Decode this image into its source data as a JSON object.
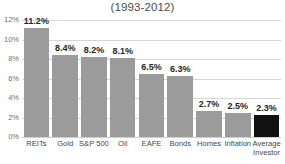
{
  "chart_data": {
    "type": "bar",
    "title": "(1993-2012)",
    "xlabel": "",
    "ylabel": "",
    "ylim": [
      0,
      12
    ],
    "grid": true,
    "legend": null,
    "y_ticks": [
      "0%",
      "2%",
      "4%",
      "6%",
      "8%",
      "10%",
      "12%"
    ],
    "y_tick_values": [
      0,
      2,
      4,
      6,
      8,
      10,
      12
    ],
    "categories": [
      "REITs",
      "Gold",
      "S&P 500",
      "Oil",
      "EAFE",
      "Bonds",
      "Homes",
      "Inflation",
      "Average Investor"
    ],
    "category_lines": [
      [
        "REITs"
      ],
      [
        "Gold"
      ],
      [
        "S&P 500"
      ],
      [
        "Oil"
      ],
      [
        "EAFE"
      ],
      [
        "Bonds"
      ],
      [
        "Homes"
      ],
      [
        "Inflation"
      ],
      [
        "Average",
        "Investor"
      ]
    ],
    "values": [
      11.2,
      8.4,
      8.2,
      8.1,
      6.5,
      6.3,
      2.7,
      2.5,
      2.3
    ],
    "value_labels": [
      "11.2%",
      "8.4%",
      "8.2%",
      "8.1%",
      "6.5%",
      "6.3%",
      "2.7%",
      "2.5%",
      "2.3%"
    ],
    "bar_colors": [
      "#9b9b9b",
      "#9b9b9b",
      "#9b9b9b",
      "#9b9b9b",
      "#9b9b9b",
      "#9b9b9b",
      "#9b9b9b",
      "#9b9b9b",
      "#111111"
    ],
    "highlight_index": 8,
    "colors": {
      "bar": "#9b9b9b",
      "highlight_bar": "#111111",
      "gridline": "#d6d6d6",
      "text": "#3a3a3a",
      "tick_text": "#6f6f6f",
      "background": "#ffffff"
    }
  }
}
